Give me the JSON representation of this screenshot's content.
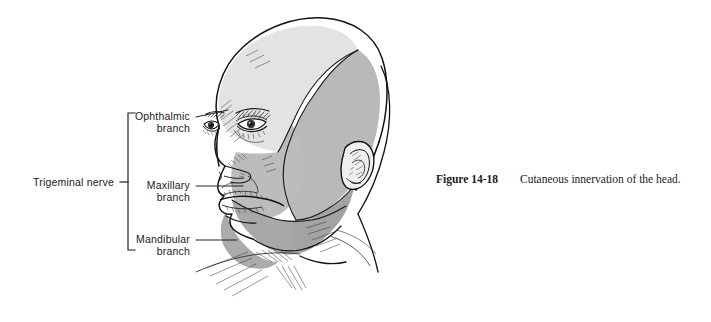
{
  "figure": {
    "caption_number": "Figure 14-18",
    "caption_text": "Cutaneous innervation of the head.",
    "background_color": "#ffffff",
    "ink_color": "#1a1a1a"
  },
  "bracket": {
    "group_label": "Trigeminal nerve",
    "name": "trigeminal-nerve-bracket"
  },
  "labels": [
    {
      "id": "ophthalmic",
      "line1": "Ophthalmic",
      "line2": "branch"
    },
    {
      "id": "maxillary",
      "line1": "Maxillary",
      "line2": "branch"
    },
    {
      "id": "mandibular",
      "line1": "Mandibular",
      "line2": "branch"
    }
  ],
  "dermatomes": [
    {
      "id": "ophthalmic-zone",
      "label": "Ophthalmic branch",
      "fill": "#e3e3e3"
    },
    {
      "id": "maxillary-zone",
      "label": "Maxillary branch",
      "fill": "#b9b9b9"
    },
    {
      "id": "mandibular-zone",
      "label": "Mandibular branch",
      "fill": "#a8a8a8"
    }
  ],
  "anatomy": {
    "view": "three-quarter right profile of a male head",
    "parts": [
      "scalp",
      "forehead",
      "eyebrows",
      "eyes",
      "nose",
      "mouth",
      "chin",
      "ear",
      "neck"
    ]
  }
}
